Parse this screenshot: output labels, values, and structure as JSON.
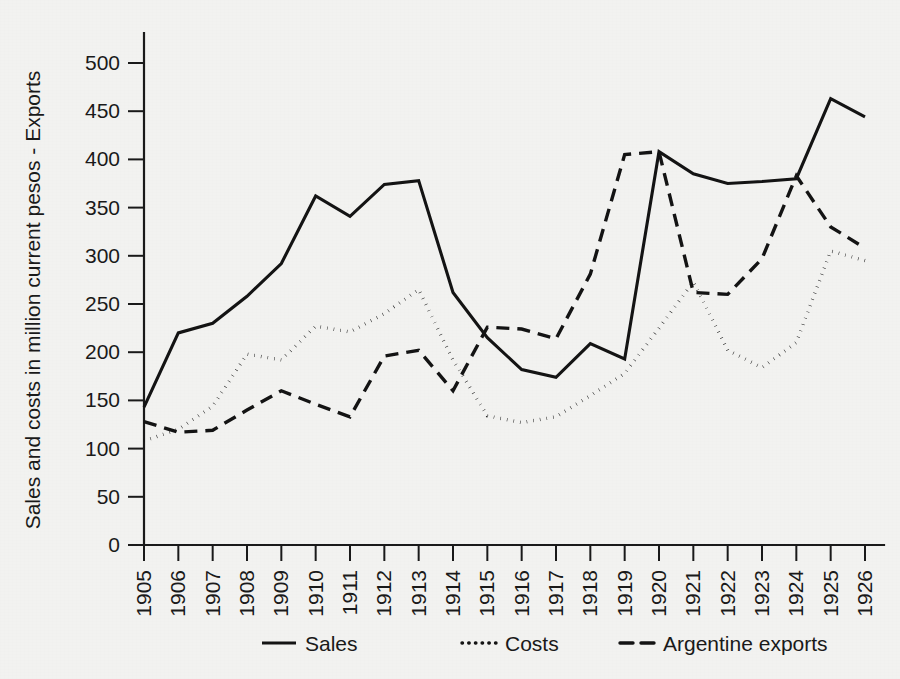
{
  "chart_data": {
    "type": "line",
    "title": "",
    "subtitle": "",
    "xlabel": "",
    "ylabel": "Sales and costs in million current pesos - Exports",
    "x": [
      1905,
      1906,
      1907,
      1908,
      1909,
      1910,
      1911,
      1912,
      1913,
      1914,
      1915,
      1916,
      1917,
      1918,
      1919,
      1920,
      1921,
      1922,
      1923,
      1924,
      1925,
      1926
    ],
    "categories": [
      "1905",
      "1906",
      "1907",
      "1908",
      "1909",
      "1910",
      "1911",
      "1912",
      "1913",
      "1914",
      "1915",
      "1916",
      "1917",
      "1918",
      "1919",
      "1920",
      "1921",
      "1922",
      "1923",
      "1924",
      "1925",
      "1926"
    ],
    "xlim": [
      1905,
      1926
    ],
    "ylim": [
      0,
      500
    ],
    "yticks": [
      0,
      50,
      100,
      150,
      200,
      250,
      300,
      350,
      400,
      450,
      500
    ],
    "ytick_labels": [
      "0",
      "50",
      "100",
      "150",
      "200",
      "250",
      "300",
      "350",
      "400",
      "450",
      "500"
    ],
    "grid": false,
    "legend_position": "bottom",
    "series": [
      {
        "name": "Sales",
        "style": "solid",
        "color": "#141414",
        "values": [
          143,
          220,
          230,
          258,
          292,
          362,
          341,
          374,
          378,
          262,
          215,
          182,
          174,
          209,
          193,
          408,
          385,
          375,
          377,
          380,
          463,
          444
        ]
      },
      {
        "name": "Costs",
        "style": "dotted",
        "color": "#141414",
        "values": [
          108,
          120,
          144,
          198,
          192,
          227,
          221,
          240,
          265,
          192,
          134,
          127,
          133,
          155,
          178,
          225,
          273,
          202,
          184,
          210,
          305,
          295
        ]
      },
      {
        "name": "Argentine exports",
        "style": "dashed",
        "color": "#141414",
        "values": [
          128,
          117,
          119,
          140,
          160,
          146,
          133,
          196,
          202,
          160,
          226,
          224,
          214,
          281,
          405,
          408,
          262,
          260,
          297,
          383,
          330,
          308
        ]
      }
    ]
  },
  "legend": {
    "items": [
      {
        "label": "Sales",
        "marker": "solid-line-marker"
      },
      {
        "label": "Costs",
        "marker": "dotted-line-marker"
      },
      {
        "label": "Argentine exports",
        "marker": "dashed-line-marker"
      }
    ]
  },
  "colors": {
    "background": "#f2f2f0",
    "ink": "#141414"
  }
}
